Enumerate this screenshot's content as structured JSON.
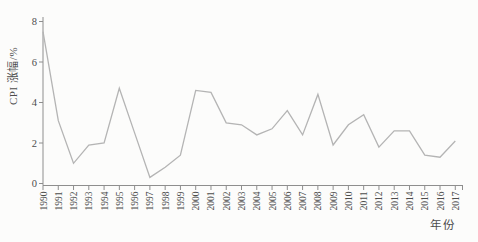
{
  "page": {
    "background": "#fcfcfb"
  },
  "chart_data": {
    "type": "line",
    "x": [
      "1990",
      "1991",
      "1992",
      "1993",
      "1994",
      "1995",
      "1996",
      "1997",
      "1998",
      "1999",
      "2000",
      "2001",
      "2002",
      "2003",
      "2004",
      "2005",
      "2006",
      "2007",
      "2008",
      "2009",
      "2010",
      "2011",
      "2012",
      "2013",
      "2014",
      "2015",
      "2016",
      "2017"
    ],
    "series": [
      {
        "name": "CPI涨幅",
        "values": [
          7.5,
          3.1,
          1.0,
          1.9,
          2.0,
          4.7,
          2.5,
          0.3,
          0.8,
          1.4,
          4.6,
          4.5,
          3.0,
          2.9,
          2.4,
          2.7,
          3.6,
          2.4,
          4.4,
          1.9,
          2.9,
          3.4,
          1.8,
          2.6,
          2.6,
          1.4,
          1.3,
          2.1
        ]
      }
    ],
    "title": "",
    "xlabel": "年份",
    "ylabel": "CPI 涨幅/%",
    "ylim": [
      0,
      8
    ],
    "yticks": [
      0,
      2,
      4,
      6,
      8
    ],
    "grid": false,
    "legend": "none",
    "colors": {
      "line": "#b4b4b4",
      "axis": "#8e8e8e",
      "tick_text": "#4c4c4c"
    }
  }
}
